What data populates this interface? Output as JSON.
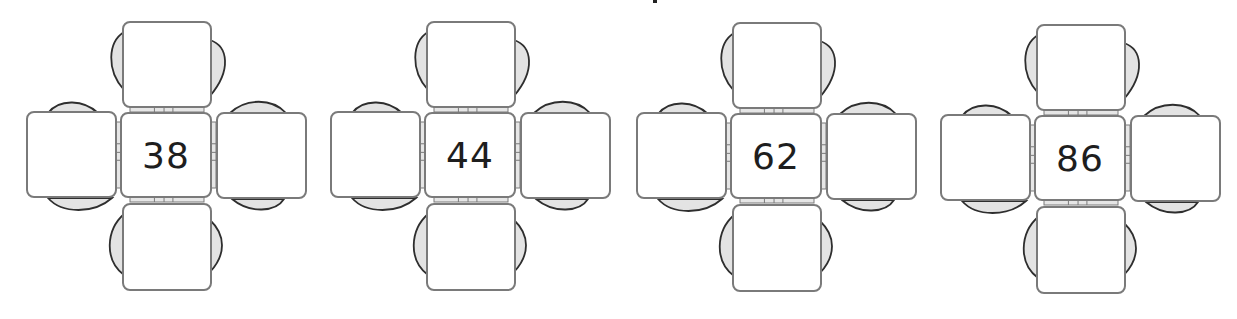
{
  "diagram": {
    "type": "table-arrangements",
    "clusters": [
      {
        "id": "cluster-1",
        "value": "38",
        "offset_x": 0
      },
      {
        "id": "cluster-2",
        "value": "44",
        "offset_x": 304
      },
      {
        "id": "cluster-3",
        "value": "62",
        "offset_x": 610
      },
      {
        "id": "cluster-4",
        "value": "86",
        "offset_x": 914
      }
    ],
    "colors": {
      "box_border": "#7a7a7a",
      "box_fill": "#ffffff",
      "chair_back_outline": "#2e2e2e",
      "chair_back_fill": "#e3e3e3",
      "hinge_fill": "#e6e6e6",
      "text": "#1e1e1e"
    }
  }
}
